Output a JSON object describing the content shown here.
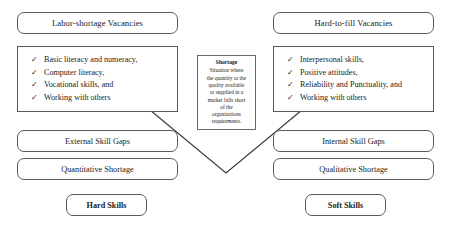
{
  "diagram": {
    "background_color": "#ffffff",
    "line_color": "#5a5a5a",
    "text_color": "#1a1a1a"
  },
  "left_column": {
    "header": "Labor-shortage Vacancies",
    "checklist": [
      {
        "marker": "✓",
        "text": "Basic literacy and numeracy,"
      },
      {
        "marker": "✓",
        "text": "Computer literacy,"
      },
      {
        "marker": "✓",
        "text": "Vocational skills, and"
      },
      {
        "marker": "✓",
        "text": "Working with others"
      }
    ],
    "gap_label": "External Skill Gaps",
    "shortage_label": "Quantitative Shortage",
    "skill_label": "Hard Skills"
  },
  "right_column": {
    "header": "Hard-to-fill Vacancies",
    "checklist": [
      {
        "marker": "✓",
        "text": "Interpersonal skills,"
      },
      {
        "marker": "✓",
        "text": "Positive attitudes,"
      },
      {
        "marker": "✓",
        "text": "Reliability and Punctuality, and"
      },
      {
        "marker": "✓",
        "text": "Working with others"
      }
    ],
    "gap_label": "Internal Skill Gaps",
    "shortage_label": "Qualitative Shortage",
    "skill_label": "Soft Skills"
  },
  "center_definition": {
    "term": "Shortage",
    "line1": "Situation where",
    "line2": "the quantity or the",
    "line3": "quality available",
    "line4": "or supplied in a",
    "line5": "market falls short",
    "line6": "of the",
    "line7": "organizations",
    "line8": "requirements."
  },
  "connector": {
    "shape": "v-arrow",
    "apex_x": 226,
    "apex_y": 173
  }
}
